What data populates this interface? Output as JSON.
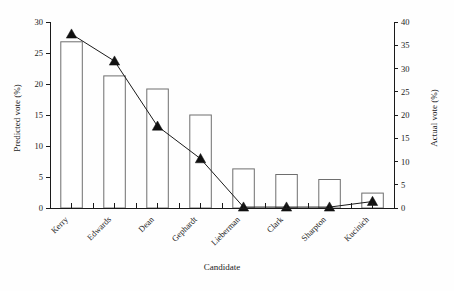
{
  "chart_data": {
    "type": "bar",
    "title": "",
    "subtitle": "",
    "xlabel": "Candidate",
    "ylabel": "Predicted vote (%)",
    "y2label": "Actual vote (%)",
    "categories": [
      "Kerry",
      "Edwards",
      "Dean",
      "Gephardt",
      "Lieberman",
      "Clark",
      "Sharpton",
      "Kucinich"
    ],
    "ylim": [
      0,
      30
    ],
    "yticks": [
      0,
      5,
      10,
      15,
      20,
      25,
      30
    ],
    "ytick_labels": [
      "0",
      "5",
      "10",
      "15",
      "20",
      "25",
      "30"
    ],
    "y2lim": [
      0,
      40
    ],
    "y2ticks": [
      0,
      5,
      10,
      15,
      20,
      25,
      30,
      35,
      40
    ],
    "y2tick_labels": [
      "0",
      "5",
      "10",
      "15",
      "20",
      "25",
      "30",
      "35",
      "40"
    ],
    "grid": false,
    "legend_position": "none",
    "series": [
      {
        "name": "Predicted vote (%)",
        "type": "bar",
        "axis": "left",
        "values": [
          26.8,
          21.3,
          19.2,
          15.0,
          6.3,
          5.4,
          4.6,
          2.4
        ]
      },
      {
        "name": "Actual vote (%)",
        "type": "line",
        "axis": "right",
        "marker": "triangle-up",
        "values": [
          37.4,
          31.6,
          17.6,
          10.6,
          0.2,
          0.2,
          0.2,
          1.4
        ]
      }
    ]
  },
  "figure": {
    "bar_fill": "#ffffff",
    "bar_stroke": "#6e6e6e",
    "line_color": "#1a1a1a",
    "marker_color": "#111111",
    "axis_color": "#1a1a1a",
    "background": "#fefefe"
  }
}
